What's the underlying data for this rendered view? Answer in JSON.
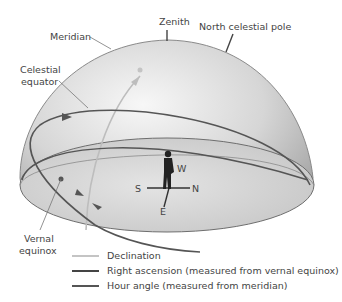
{
  "figure": {
    "labels": {
      "zenith": "Zenith",
      "north_celestial_pole": "North celestial pole",
      "meridian": "Meridian",
      "celestial_equator_line1": "Celestial",
      "celestial_equator_line2": "equator",
      "vernal_equinox_line1": "Vernal",
      "vernal_equinox_line2": "equinox",
      "compass_s": "S",
      "compass_n": "N",
      "compass_e": "E",
      "compass_w": "W"
    },
    "colors": {
      "dome_light": "#f3f3f3",
      "dome_dark": "#a9a9a9",
      "dome_edge": "#8a8a8a",
      "declination": "#bdbdbd",
      "right_ascension": "#555555",
      "hour_angle": "#555555",
      "text": "#444444"
    }
  },
  "legend": [
    {
      "label": "Declination",
      "color": "#bdbdbd"
    },
    {
      "label": "Right ascension (measured from vernal equinox)",
      "color": "#444444"
    },
    {
      "label": "Hour angle (measured from meridian)",
      "color": "#555555"
    }
  ]
}
